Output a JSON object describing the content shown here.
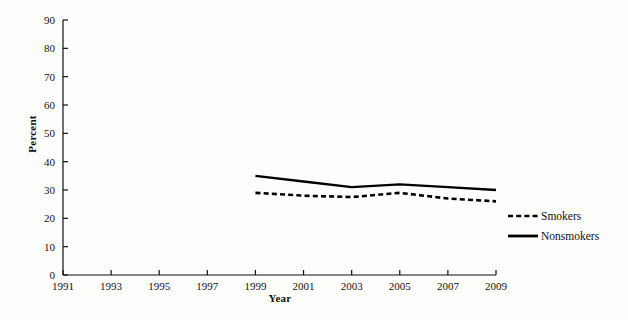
{
  "chart_data": {
    "type": "line",
    "title": "",
    "xlabel": "Year",
    "ylabel": "Percent",
    "xlim": [
      1991,
      2009
    ],
    "ylim": [
      0,
      90
    ],
    "ytick_step": 10,
    "xtick_step": 2,
    "grid": false,
    "legend_position": "right-middle",
    "xticks": [
      "1991",
      "1993",
      "1995",
      "1997",
      "1999",
      "2001",
      "2003",
      "2005",
      "2007",
      "2009"
    ],
    "yticks": [
      "0",
      "10",
      "20",
      "30",
      "40",
      "50",
      "60",
      "70",
      "80",
      "90"
    ],
    "x": [
      1999,
      2001,
      2003,
      2005,
      2007,
      2009
    ],
    "series": [
      {
        "name": "Nonsmokers",
        "style": "solid",
        "color": "#000000",
        "values": [
          35,
          33,
          31,
          32,
          31,
          30
        ]
      },
      {
        "name": "Smokers",
        "style": "dashed",
        "color": "#000000",
        "values": [
          29,
          28,
          27.5,
          29,
          27,
          26
        ]
      }
    ]
  },
  "legend": {
    "items": [
      {
        "label": "Smokers",
        "style": "dashed"
      },
      {
        "label": "Nonsmokers",
        "style": "solid"
      }
    ]
  },
  "axes": {
    "y_title": "Percent",
    "x_title": "Year"
  }
}
